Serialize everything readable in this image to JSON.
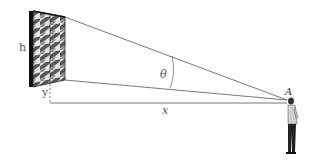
{
  "diagram": {
    "labels": {
      "height": "h",
      "elevation": "y",
      "distance": "x",
      "angle": "θ",
      "viewer_point": "A"
    },
    "colors": {
      "line": "#444444",
      "frame": "#111111",
      "pattern_dark": "#555555",
      "pattern_light": "#e8e8e8"
    }
  }
}
